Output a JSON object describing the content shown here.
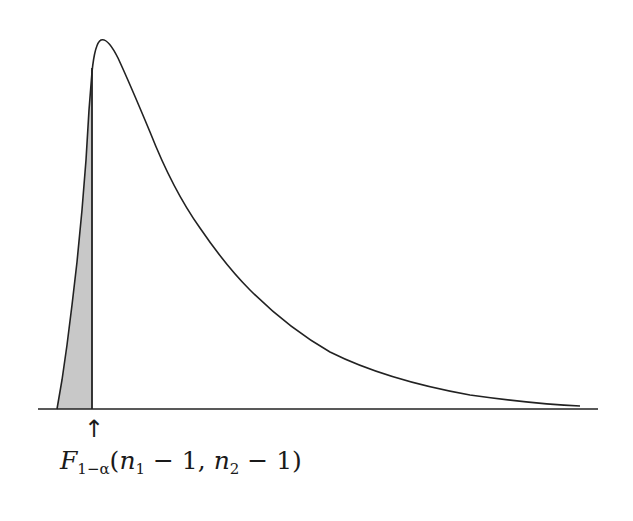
{
  "figure": {
    "type": "F-distribution density curve",
    "shaded_region": "left tail (lower critical region)",
    "colors": {
      "curve": "#222222",
      "shade": "#c8c8c8",
      "axis": "#222222"
    }
  },
  "annotation": {
    "arrow_glyph": "↑",
    "label": {
      "symbol": "F",
      "subscript": "1−α",
      "open_paren": "(",
      "arg1_var": "n",
      "arg1_sub": "1",
      "arg1_rest": " − 1, ",
      "arg2_var": "n",
      "arg2_sub": "2",
      "arg2_rest": " − 1",
      "close_paren": ")"
    },
    "full_text": "F_{1−α}(n_1 − 1, n_2 − 1)"
  }
}
